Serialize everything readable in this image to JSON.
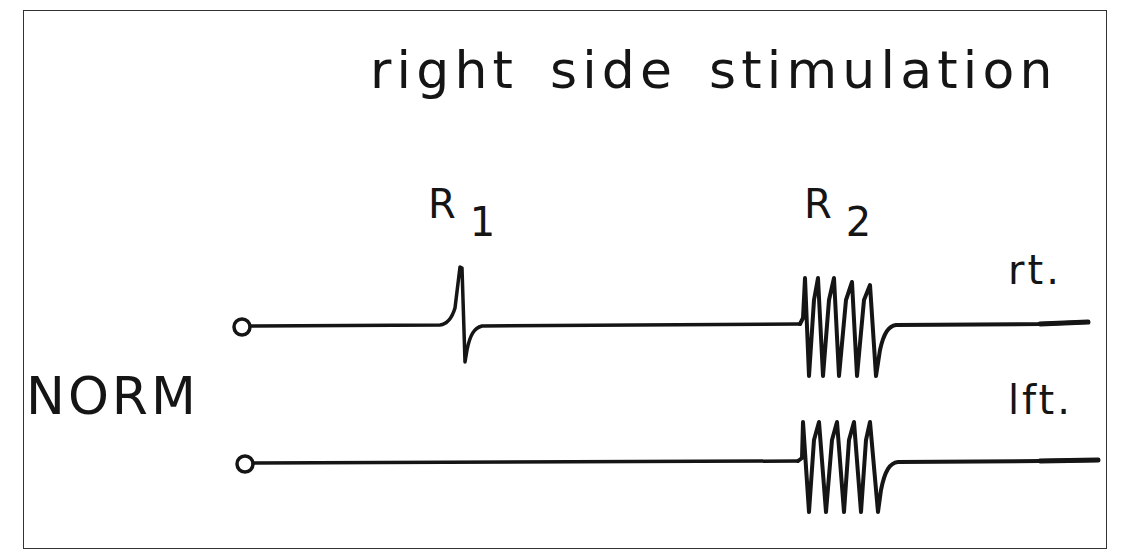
{
  "figure": {
    "title": "right side stimulation",
    "condition_label": "NORM",
    "components": [
      {
        "label": "R",
        "subscript": "1"
      },
      {
        "label": "R",
        "subscript": "2"
      }
    ],
    "traces": [
      {
        "side_label": "rt.",
        "has_R1": true,
        "has_R2": true
      },
      {
        "side_label": "lft.",
        "has_R1": false,
        "has_R2": true
      }
    ],
    "colors": {
      "ink": "#151515",
      "frame": "#333333",
      "background": "#ffffff"
    }
  }
}
